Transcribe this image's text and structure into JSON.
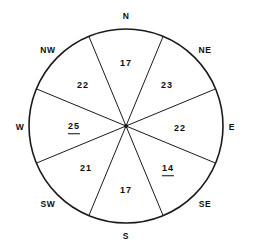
{
  "figure": {
    "kind": "wind-rose",
    "stroke_color": "#1a1a1a",
    "text_color": "#0d0d0d",
    "background_color": "#ffffff"
  },
  "chart_data": {
    "type": "pie",
    "title": "",
    "xlabel": "",
    "ylabel": "",
    "legend": "none",
    "grid": false,
    "categories": [
      "N",
      "NE",
      "E",
      "SE",
      "S",
      "SW",
      "W",
      "NW"
    ],
    "values": [
      17,
      23,
      22,
      14,
      17,
      21,
      25,
      22
    ],
    "annotations": [
      "25 underlined",
      "14 underlined"
    ],
    "sectors": [
      {
        "direction": "N",
        "value": "17",
        "underlined": false,
        "label_x": 126,
        "label_y": 63,
        "dir_x": 126,
        "dir_y": 16
      },
      {
        "direction": "NE",
        "value": "23",
        "underlined": false,
        "label_x": 167,
        "label_y": 85,
        "dir_x": 205,
        "dir_y": 50
      },
      {
        "direction": "E",
        "value": "22",
        "underlined": false,
        "label_x": 180,
        "label_y": 128,
        "dir_x": 232,
        "dir_y": 127
      },
      {
        "direction": "SE",
        "value": "14",
        "underlined": true,
        "label_x": 168,
        "label_y": 170,
        "dir_x": 205,
        "dir_y": 204
      },
      {
        "direction": "S",
        "value": "17",
        "underlined": false,
        "label_x": 126,
        "label_y": 190,
        "dir_x": 126,
        "dir_y": 236
      },
      {
        "direction": "SW",
        "value": "21",
        "underlined": false,
        "label_x": 86,
        "label_y": 168,
        "dir_x": 48,
        "dir_y": 204
      },
      {
        "direction": "W",
        "value": "25",
        "underlined": true,
        "label_x": 74,
        "label_y": 128,
        "dir_x": 20,
        "dir_y": 127
      },
      {
        "direction": "NW",
        "value": "22",
        "underlined": false,
        "label_x": 83,
        "label_y": 85,
        "dir_x": 48,
        "dir_y": 50
      }
    ]
  },
  "geometry": {
    "center_x": 126,
    "center_y": 126,
    "radius": 97,
    "divider_count": 4,
    "divider_offset_degrees": 22.5
  }
}
